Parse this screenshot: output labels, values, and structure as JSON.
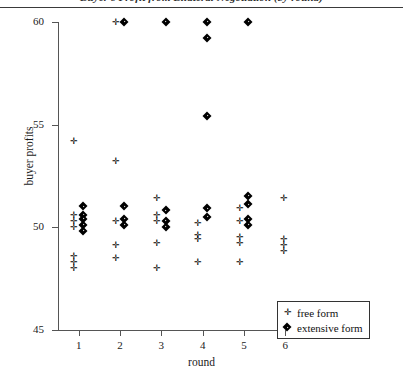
{
  "chart_data": {
    "type": "scatter",
    "title": "Buyer's Profit from Bilateral Negotiation (by round)",
    "xlabel": "round",
    "ylabel": "buyer profits",
    "xlim": [
      0.5,
      6.5
    ],
    "ylim": [
      45,
      60
    ],
    "xticks": [
      1,
      2,
      3,
      4,
      5,
      6
    ],
    "xtick_labels": [
      "1",
      "2",
      "3",
      "4",
      "5",
      "6"
    ],
    "yticks": [
      45,
      50,
      55,
      60
    ],
    "ytick_labels": [
      "45",
      "50",
      "55",
      "60"
    ],
    "grid": false,
    "legend_position": "bottom-right",
    "series": [
      {
        "name": "free form",
        "marker": "plus",
        "color": "#000000",
        "points": [
          {
            "x": 0.88,
            "y": 54.2
          },
          {
            "x": 0.88,
            "y": 50.6
          },
          {
            "x": 0.88,
            "y": 50.3
          },
          {
            "x": 0.88,
            "y": 50.0
          },
          {
            "x": 0.88,
            "y": 48.6
          },
          {
            "x": 0.88,
            "y": 48.3
          },
          {
            "x": 0.88,
            "y": 48.0
          },
          {
            "x": 1.88,
            "y": 60.0
          },
          {
            "x": 1.88,
            "y": 53.2
          },
          {
            "x": 1.88,
            "y": 50.3
          },
          {
            "x": 1.88,
            "y": 49.1
          },
          {
            "x": 1.88,
            "y": 48.5
          },
          {
            "x": 2.88,
            "y": 51.4
          },
          {
            "x": 2.88,
            "y": 50.6
          },
          {
            "x": 2.88,
            "y": 50.3
          },
          {
            "x": 2.88,
            "y": 49.2
          },
          {
            "x": 2.88,
            "y": 48.0
          },
          {
            "x": 3.88,
            "y": 50.2
          },
          {
            "x": 3.88,
            "y": 49.6
          },
          {
            "x": 3.88,
            "y": 49.4
          },
          {
            "x": 3.88,
            "y": 48.3
          },
          {
            "x": 4.88,
            "y": 50.9
          },
          {
            "x": 4.88,
            "y": 50.3
          },
          {
            "x": 4.88,
            "y": 49.5
          },
          {
            "x": 4.88,
            "y": 49.2
          },
          {
            "x": 4.88,
            "y": 48.3
          },
          {
            "x": 5.95,
            "y": 51.4
          },
          {
            "x": 5.95,
            "y": 49.4
          },
          {
            "x": 5.95,
            "y": 49.1
          },
          {
            "x": 5.95,
            "y": 48.8
          }
        ]
      },
      {
        "name": "extensive form",
        "marker": "diamond",
        "color": "#000000",
        "points": [
          {
            "x": 1.12,
            "y": 51.0
          },
          {
            "x": 1.12,
            "y": 50.6
          },
          {
            "x": 1.12,
            "y": 50.4
          },
          {
            "x": 1.12,
            "y": 50.1
          },
          {
            "x": 1.12,
            "y": 49.8
          },
          {
            "x": 2.12,
            "y": 60.0
          },
          {
            "x": 2.12,
            "y": 51.0
          },
          {
            "x": 2.12,
            "y": 50.4
          },
          {
            "x": 2.12,
            "y": 50.1
          },
          {
            "x": 3.12,
            "y": 60.0
          },
          {
            "x": 3.12,
            "y": 50.8
          },
          {
            "x": 3.12,
            "y": 50.3
          },
          {
            "x": 3.12,
            "y": 50.0
          },
          {
            "x": 4.12,
            "y": 60.0
          },
          {
            "x": 4.12,
            "y": 59.2
          },
          {
            "x": 4.12,
            "y": 55.4
          },
          {
            "x": 4.12,
            "y": 50.9
          },
          {
            "x": 4.12,
            "y": 50.5
          },
          {
            "x": 5.12,
            "y": 60.0
          },
          {
            "x": 5.12,
            "y": 51.5
          },
          {
            "x": 5.12,
            "y": 51.1
          },
          {
            "x": 5.12,
            "y": 50.4
          },
          {
            "x": 5.12,
            "y": 50.1
          }
        ]
      }
    ]
  }
}
